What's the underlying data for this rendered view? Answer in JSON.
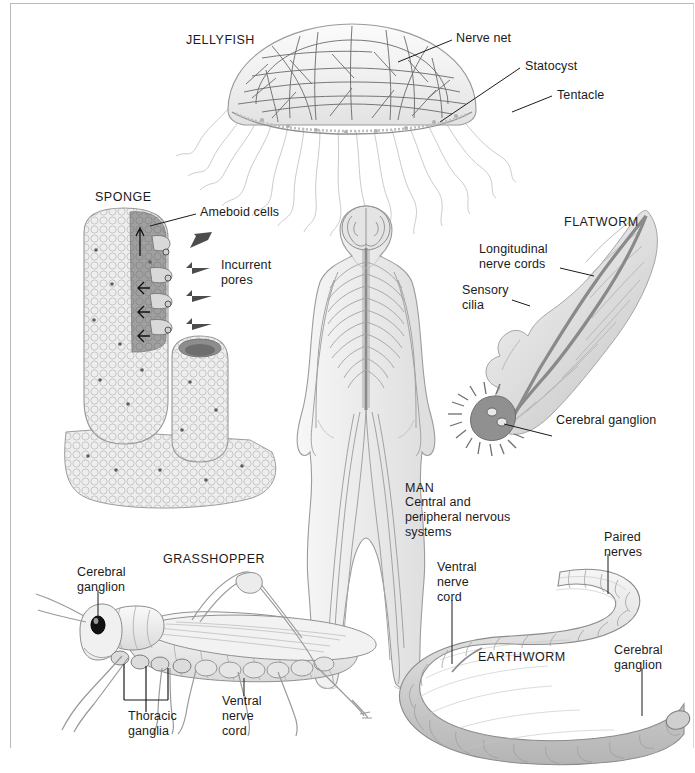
{
  "figure": {
    "background_color": "#ffffff",
    "ink_color": "#1b1b1b",
    "frame_color": "#b9b9b9"
  },
  "organisms": [
    {
      "key": "jellyfish",
      "heading": "JELLYFISH",
      "labels": [
        "Nerve net",
        "Statocyst",
        "Tentacle"
      ]
    },
    {
      "key": "sponge",
      "heading": "SPONGE",
      "labels": [
        "Ameboid cells",
        "Incurrent",
        "pores"
      ]
    },
    {
      "key": "flatworm",
      "heading": "FLATWORM",
      "labels": [
        "Longitudinal",
        "nerve cords",
        "Sensory",
        "cilia",
        "Cerebral ganglion"
      ]
    },
    {
      "key": "man",
      "heading": "MAN",
      "labels": [
        "Central and",
        "peripheral nervous",
        "systems"
      ]
    },
    {
      "key": "grasshopper",
      "heading": "GRASSHOPPER",
      "labels": [
        "Cerebral",
        "ganglion",
        "Thoracic",
        "ganglia",
        "Ventral",
        "nerve",
        "cord"
      ]
    },
    {
      "key": "earthworm",
      "heading": "EARTHWORM",
      "labels": [
        "Paired",
        "nerves",
        "Ventral",
        "nerve",
        "cord",
        "Cerebral",
        "ganglion"
      ]
    }
  ],
  "jellyfish": {
    "heading": "JELLYFISH",
    "nerve_net": "Nerve net",
    "statocyst": "Statocyst",
    "tentacle": "Tentacle"
  },
  "sponge": {
    "heading": "SPONGE",
    "ameboid_cells": "Ameboid cells",
    "incurrent_line1": "Incurrent",
    "incurrent_line2": "pores"
  },
  "flatworm": {
    "heading": "FLATWORM",
    "longitudinal_line1": "Longitudinal",
    "longitudinal_line2": "nerve cords",
    "sensory_line1": "Sensory",
    "sensory_line2": "cilia",
    "cerebral_ganglion": "Cerebral ganglion"
  },
  "man": {
    "heading": "MAN",
    "caption_line1": "Central and",
    "caption_line2": "peripheral nervous",
    "caption_line3": "systems"
  },
  "grasshopper": {
    "heading": "GRASSHOPPER",
    "cerebral_line1": "Cerebral",
    "cerebral_line2": "ganglion",
    "thoracic_line1": "Thoracic",
    "thoracic_line2": "ganglia",
    "ventral_line1": "Ventral",
    "ventral_line2": "nerve",
    "ventral_line3": "cord"
  },
  "earthworm": {
    "heading": "EARTHWORM",
    "paired_line1": "Paired",
    "paired_line2": "nerves",
    "ventral_line1": "Ventral",
    "ventral_line2": "nerve",
    "ventral_line3": "cord",
    "cerebral_line1": "Cerebral",
    "cerebral_line2": "ganglion"
  }
}
